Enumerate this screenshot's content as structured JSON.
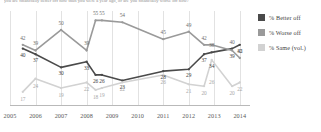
{
  "question": "you are financially better off now than you were a year ago, or are you financially worse off now?",
  "legend": {
    "position": "right",
    "items": [
      {
        "label": "% Better off",
        "color": "#4a4a4a"
      },
      {
        "label": "% Worse off",
        "color": "#9a9a9a"
      },
      {
        "label": "% Same (vol.)",
        "color": "#d2d2d2"
      }
    ]
  },
  "axis": {
    "ticks": [
      "2005",
      "2006",
      "2007",
      "2008",
      "2009",
      "2010",
      "2011",
      "2012",
      "2013",
      "2014"
    ]
  },
  "chart_data": {
    "type": "line",
    "title": "",
    "xlabel": "",
    "ylabel": "",
    "ylim": [
      10,
      60
    ],
    "grid": "vertical",
    "legend_position": "right",
    "x": [
      2005.5,
      2006,
      2007,
      2008,
      2008.35,
      2008.6,
      2009.4,
      2011,
      2012,
      2012.6,
      2012.9,
      2013.7,
      2014
    ],
    "categories": [
      "2005",
      "2006",
      "2007",
      "2008",
      "2008",
      "2008",
      "2009",
      "2011",
      "2012",
      "2012",
      "2013",
      "2013",
      "2014"
    ],
    "series": [
      {
        "name": "% Better off",
        "color": "#4a4a4a",
        "values": [
          40,
          37,
          30,
          33,
          26,
          26,
          23,
          28,
          29,
          37,
          38,
          40,
          42
        ]
      },
      {
        "name": "% Worse off",
        "color": "#9a9a9a",
        "values": [
          42,
          39,
          50,
          39,
          55,
          55,
          54,
          45,
          49,
          42,
          42,
          39,
          35
        ]
      },
      {
        "name": "% Same (vol.)",
        "color": "#d2d2d2",
        "values": [
          17,
          24,
          19,
          22,
          18,
          19,
          22,
          26,
          21,
          20,
          34,
          20,
          22
        ]
      }
    ],
    "labels": [
      {
        "series": "% Worse off",
        "value": 42,
        "x": 2005.5
      },
      {
        "series": "% Better off",
        "value": 40,
        "x": 2005.5
      },
      {
        "series": "% Same (vol.)",
        "value": 17,
        "x": 2005.5
      },
      {
        "series": "% Worse off",
        "value": 39,
        "x": 2006
      },
      {
        "series": "% Better off",
        "value": 37,
        "x": 2006
      },
      {
        "series": "% Same (vol.)",
        "value": 24,
        "x": 2006
      },
      {
        "series": "% Worse off",
        "value": 50,
        "x": 2007
      },
      {
        "series": "% Better off",
        "value": 30,
        "x": 2007
      },
      {
        "series": "% Same (vol.)",
        "value": 19,
        "x": 2007
      },
      {
        "series": "% Worse off",
        "value": 39,
        "x": 2008
      },
      {
        "series": "% Better off",
        "value": 33,
        "x": 2008
      },
      {
        "series": "% Same (vol.)",
        "value": 22,
        "x": 2008
      },
      {
        "series": "% Worse off",
        "value": 55,
        "x": 2008.35
      },
      {
        "series": "% Worse off",
        "value": 55,
        "x": 2008.6
      },
      {
        "series": "% Better off",
        "value": 26,
        "x": 2008.35
      },
      {
        "series": "% Better off",
        "value": 26,
        "x": 2008.6
      },
      {
        "series": "% Same (vol.)",
        "value": 18,
        "x": 2008.35
      },
      {
        "series": "% Same (vol.)",
        "value": 19,
        "x": 2008.6
      },
      {
        "series": "% Worse off",
        "value": 54,
        "x": 2009.4
      },
      {
        "series": "% Better off",
        "value": 23,
        "x": 2009.4
      },
      {
        "series": "% Same (vol.)",
        "value": 22,
        "x": 2009.4
      },
      {
        "series": "% Worse off",
        "value": 45,
        "x": 2011
      },
      {
        "series": "% Better off",
        "value": 28,
        "x": 2011
      },
      {
        "series": "% Same (vol.)",
        "value": 26,
        "x": 2011
      },
      {
        "series": "% Worse off",
        "value": 49,
        "x": 2012
      },
      {
        "series": "% Better off",
        "value": 29,
        "x": 2012
      },
      {
        "series": "% Same (vol.)",
        "value": 21,
        "x": 2012
      },
      {
        "series": "% Worse off",
        "value": 42,
        "x": 2012.6
      },
      {
        "series": "% Better off",
        "value": 37,
        "x": 2012.6
      },
      {
        "series": "% Same (vol.)",
        "value": 20,
        "x": 2012.6
      },
      {
        "series": "% Worse off",
        "value": 38,
        "x": 2012.9
      },
      {
        "series": "% Better off",
        "value": 34,
        "x": 2012.9
      },
      {
        "series": "% Same (vol.)",
        "value": 26,
        "x": 2012.9
      },
      {
        "series": "% Worse off",
        "value": 40,
        "x": 2013.7
      },
      {
        "series": "% Better off",
        "value": 39,
        "x": 2013.7
      },
      {
        "series": "% Same (vol.)",
        "value": 20,
        "x": 2013.7
      },
      {
        "series": "% Better off",
        "value": 42,
        "x": 2014
      },
      {
        "series": "% Worse off",
        "value": 35,
        "x": 2014
      },
      {
        "series": "% Same (vol.)",
        "value": 22,
        "x": 2014
      }
    ]
  }
}
